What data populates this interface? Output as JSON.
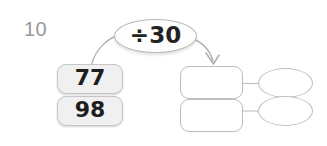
{
  "worksheet": {
    "question_number": "10",
    "operation": {
      "label": "÷30",
      "operator_symbol": "÷",
      "operand": "30"
    },
    "inputs": [
      {
        "value": "77"
      },
      {
        "value": "98"
      }
    ],
    "answers": [
      {
        "box_value": "",
        "oval_value": ""
      },
      {
        "box_value": "",
        "oval_value": ""
      }
    ],
    "colors": {
      "question_number": "#9a9a9a",
      "input_box_fill": "#f0f0f0",
      "input_box_border": "#c6c6c6",
      "answer_box_border": "#bdbdbd",
      "bubble_border": "#b9b9b9",
      "connector": "#b0b0b0",
      "text": "#1d1d1d",
      "background": "#ffffff"
    }
  }
}
